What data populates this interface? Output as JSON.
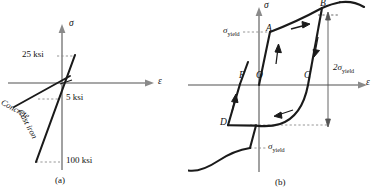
{
  "figure": {
    "kind": "stress-strain-diagrams",
    "panels": [
      {
        "id": "a",
        "caption": "(a)",
        "axes": {
          "y_label": "σ",
          "x_label": "ε"
        },
        "annotations": [
          {
            "name": "upper-stress-value",
            "text": "25 ksi"
          },
          {
            "name": "mid-stress-value",
            "text": "5 ksi"
          },
          {
            "name": "lower-stress-value",
            "text": "100 ksi"
          }
        ],
        "curves": [
          {
            "name": "concrete",
            "label": "Concrete"
          },
          {
            "name": "cast-iron",
            "label": "Cast iron"
          }
        ]
      },
      {
        "id": "b",
        "caption": "(b)",
        "axes": {
          "y_label": "σ",
          "x_label": "ε"
        },
        "points": [
          {
            "name": "point-a",
            "label": "A"
          },
          {
            "name": "point-b",
            "label": "B"
          },
          {
            "name": "point-c",
            "label": "C"
          },
          {
            "name": "point-d",
            "label": "D"
          },
          {
            "name": "point-f",
            "label": "F"
          },
          {
            "name": "origin",
            "label": "O"
          }
        ],
        "annotations": [
          {
            "name": "yield-stress-upper",
            "base": "σ",
            "sub": "yield"
          },
          {
            "name": "yield-stress-lower",
            "base": "σ",
            "sub": "yield"
          },
          {
            "name": "twice-yield-stress",
            "base": "2σ",
            "sub": "yield"
          }
        ]
      }
    ]
  },
  "colors": {
    "curve": "#1a1a1a",
    "axis": "#8a8a8a",
    "dash": "#8a8a8a",
    "background": "#ffffff"
  }
}
